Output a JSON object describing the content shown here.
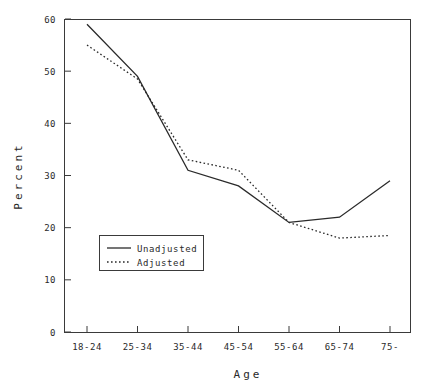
{
  "figure": {
    "faint_header": "",
    "background": "#ffffff",
    "line_color": "#2a2a2a"
  },
  "chart_data": {
    "type": "line",
    "title": "",
    "xlabel": "Age",
    "ylabel": "Percent",
    "categories": [
      "18-24",
      "25-34",
      "35-44",
      "45-54",
      "55-64",
      "65-74",
      "75-"
    ],
    "yticks": [
      0,
      10,
      20,
      30,
      40,
      50,
      60
    ],
    "ylim": [
      0,
      60
    ],
    "grid": false,
    "legend_position": "lower-left-inside",
    "series": [
      {
        "name": "Unadjusted",
        "style": "solid",
        "values": [
          59,
          49,
          31,
          28,
          21,
          22,
          29
        ]
      },
      {
        "name": "Adjusted",
        "style": "dotted",
        "values": [
          55,
          48.5,
          33,
          31,
          21,
          18,
          18.5
        ]
      }
    ]
  },
  "axes": {
    "y_tick_labels": [
      "0",
      "10",
      "20",
      "30",
      "40",
      "50",
      "60"
    ],
    "x_tick_labels": [
      "18-24",
      "25-34",
      "35-44",
      "45-54",
      "55-64",
      "65-74",
      "75-"
    ],
    "y_axis_title": "Percent",
    "x_axis_title": "Age"
  },
  "legend": {
    "entries": [
      {
        "label": "Unadjusted",
        "style": "solid"
      },
      {
        "label": "Adjusted",
        "style": "dotted"
      }
    ]
  }
}
